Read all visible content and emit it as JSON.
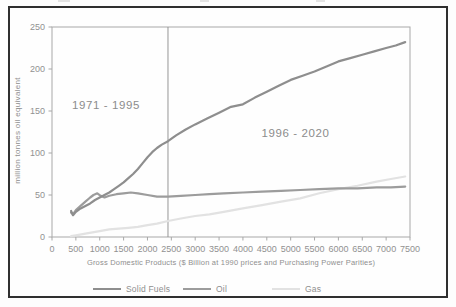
{
  "colors": {
    "frame": "#2f2f2f",
    "axis": "#a8a8a8",
    "text": "#919191",
    "divider": "#8c8c8c",
    "background": "#fefefe"
  },
  "chart_data": {
    "type": "line",
    "title": "",
    "xlabel": "Gross Domestic Products ($ Billion at 1990 prices and Purchasing Power Parities)",
    "ylabel": "million tonnes oil equivalent",
    "xlim": [
      0,
      7500
    ],
    "ylim": [
      0,
      250
    ],
    "x_ticks": [
      0,
      500,
      1000,
      1500,
      2000,
      2500,
      3000,
      3500,
      4000,
      4500,
      5000,
      5500,
      6000,
      6500,
      7000,
      7500
    ],
    "y_ticks": [
      0,
      50,
      100,
      150,
      200,
      250
    ],
    "grid": false,
    "legend_position": "bottom",
    "divider_x": 2430,
    "annotations": [
      {
        "text": "1971 - 1995",
        "x": 1130,
        "y": 155
      },
      {
        "text": "1996 - 2020",
        "x": 5100,
        "y": 122
      }
    ],
    "series": [
      {
        "name": "Solid Fuels",
        "color": "#8e8e8e",
        "width": 2.2,
        "points": [
          [
            400,
            31
          ],
          [
            440,
            26
          ],
          [
            500,
            30
          ],
          [
            600,
            34
          ],
          [
            700,
            37
          ],
          [
            800,
            40
          ],
          [
            900,
            44
          ],
          [
            1000,
            47
          ],
          [
            1100,
            50
          ],
          [
            1200,
            53
          ],
          [
            1300,
            57
          ],
          [
            1400,
            61
          ],
          [
            1500,
            65
          ],
          [
            1600,
            70
          ],
          [
            1700,
            75
          ],
          [
            1800,
            81
          ],
          [
            1900,
            88
          ],
          [
            2000,
            95
          ],
          [
            2100,
            101
          ],
          [
            2200,
            106
          ],
          [
            2300,
            110
          ],
          [
            2430,
            114
          ],
          [
            2600,
            121
          ],
          [
            2800,
            128
          ],
          [
            3000,
            134
          ],
          [
            3250,
            141
          ],
          [
            3500,
            148
          ],
          [
            3750,
            155
          ],
          [
            4000,
            158
          ],
          [
            4250,
            166
          ],
          [
            4500,
            173
          ],
          [
            4750,
            180
          ],
          [
            5000,
            187
          ],
          [
            5250,
            192
          ],
          [
            5500,
            197
          ],
          [
            5750,
            203
          ],
          [
            6000,
            209
          ],
          [
            6250,
            213
          ],
          [
            6500,
            217
          ],
          [
            6750,
            221
          ],
          [
            7000,
            225
          ],
          [
            7200,
            228
          ],
          [
            7400,
            232
          ]
        ]
      },
      {
        "name": "Oil",
        "color": "#9c9c9c",
        "width": 2.2,
        "points": [
          [
            400,
            29
          ],
          [
            440,
            27
          ],
          [
            500,
            32
          ],
          [
            600,
            37
          ],
          [
            700,
            42
          ],
          [
            800,
            47
          ],
          [
            870,
            50
          ],
          [
            950,
            52
          ],
          [
            1020,
            49
          ],
          [
            1100,
            47
          ],
          [
            1200,
            49
          ],
          [
            1350,
            51
          ],
          [
            1500,
            52
          ],
          [
            1650,
            53
          ],
          [
            1800,
            52
          ],
          [
            2000,
            50
          ],
          [
            2200,
            48
          ],
          [
            2430,
            48
          ],
          [
            2700,
            49
          ],
          [
            3000,
            50
          ],
          [
            3300,
            51
          ],
          [
            3600,
            52
          ],
          [
            4000,
            53
          ],
          [
            4400,
            54
          ],
          [
            4800,
            55
          ],
          [
            5200,
            56
          ],
          [
            5600,
            57
          ],
          [
            6000,
            58
          ],
          [
            6400,
            58
          ],
          [
            6800,
            59
          ],
          [
            7100,
            59
          ],
          [
            7400,
            60
          ]
        ]
      },
      {
        "name": "Gas",
        "color": "#e2e2e2",
        "width": 2.2,
        "points": [
          [
            400,
            1
          ],
          [
            500,
            2
          ],
          [
            700,
            4
          ],
          [
            1000,
            7
          ],
          [
            1200,
            9
          ],
          [
            1400,
            10
          ],
          [
            1600,
            11
          ],
          [
            1800,
            12
          ],
          [
            2000,
            14
          ],
          [
            2200,
            16
          ],
          [
            2430,
            19
          ],
          [
            2700,
            22
          ],
          [
            3000,
            25
          ],
          [
            3300,
            27
          ],
          [
            3600,
            30
          ],
          [
            4000,
            34
          ],
          [
            4400,
            38
          ],
          [
            4800,
            42
          ],
          [
            5200,
            46
          ],
          [
            5600,
            52
          ],
          [
            6000,
            57
          ],
          [
            6400,
            61
          ],
          [
            6800,
            66
          ],
          [
            7100,
            69
          ],
          [
            7400,
            72
          ]
        ]
      }
    ]
  }
}
